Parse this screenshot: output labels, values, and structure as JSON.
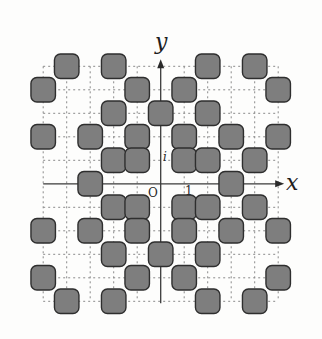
{
  "diagram": {
    "grid": {
      "min": -5,
      "max": 5,
      "unit_px": 23.5,
      "origin_px": [
        160.7,
        183.8
      ]
    },
    "axes": {
      "x_label": "x",
      "y_label": "y",
      "origin_label": "O",
      "unit_real_label": "1",
      "unit_imag_label": "i"
    },
    "colors": {
      "square_fill": "#7e7e7e",
      "square_stroke": "#2e2e2e",
      "grid": "#8a8a8a",
      "axis": "#3a3a3a",
      "background": "#fdfdfc"
    },
    "squares": [
      {
        "x": -4,
        "y": 5
      },
      {
        "x": -2,
        "y": 5
      },
      {
        "x": 2,
        "y": 5
      },
      {
        "x": 4,
        "y": 5
      },
      {
        "x": -5,
        "y": 4
      },
      {
        "x": -1,
        "y": 4
      },
      {
        "x": 1,
        "y": 4
      },
      {
        "x": 5,
        "y": 4
      },
      {
        "x": -2,
        "y": 3
      },
      {
        "x": 0,
        "y": 3
      },
      {
        "x": 2,
        "y": 3
      },
      {
        "x": -5,
        "y": 2
      },
      {
        "x": -3,
        "y": 2
      },
      {
        "x": -1,
        "y": 2
      },
      {
        "x": 1,
        "y": 2
      },
      {
        "x": 3,
        "y": 2
      },
      {
        "x": 5,
        "y": 2
      },
      {
        "x": -2,
        "y": 1
      },
      {
        "x": -1,
        "y": 1
      },
      {
        "x": 1,
        "y": 1
      },
      {
        "x": 2,
        "y": 1
      },
      {
        "x": 4,
        "y": 1
      },
      {
        "x": -3,
        "y": 0
      },
      {
        "x": 3,
        "y": 0
      },
      {
        "x": -2,
        "y": -1
      },
      {
        "x": -1,
        "y": -1
      },
      {
        "x": 1,
        "y": -1
      },
      {
        "x": 2,
        "y": -1
      },
      {
        "x": 4,
        "y": -1
      },
      {
        "x": -5,
        "y": -2
      },
      {
        "x": -3,
        "y": -2
      },
      {
        "x": -1,
        "y": -2
      },
      {
        "x": 1,
        "y": -2
      },
      {
        "x": 3,
        "y": -2
      },
      {
        "x": 5,
        "y": -2
      },
      {
        "x": -2,
        "y": -3
      },
      {
        "x": 0,
        "y": -3
      },
      {
        "x": 2,
        "y": -3
      },
      {
        "x": -5,
        "y": -4
      },
      {
        "x": -1,
        "y": -4
      },
      {
        "x": 1,
        "y": -4
      },
      {
        "x": 5,
        "y": -4
      },
      {
        "x": -4,
        "y": -5
      },
      {
        "x": -2,
        "y": -5
      },
      {
        "x": 2,
        "y": -5
      },
      {
        "x": 4,
        "y": -5
      }
    ]
  }
}
